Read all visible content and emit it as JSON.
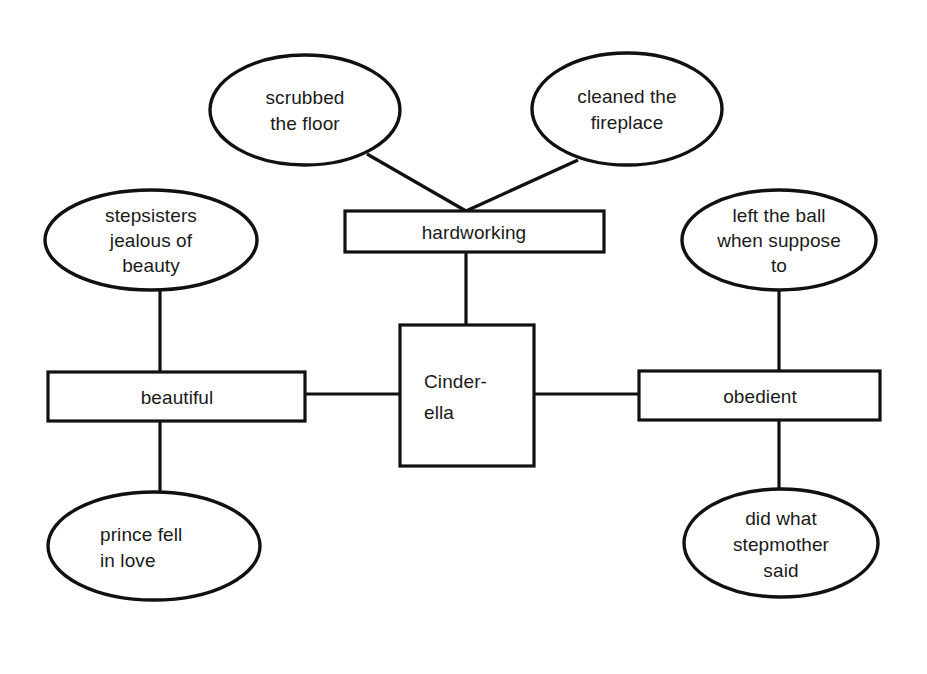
{
  "diagram": {
    "type": "concept-web",
    "background_color": "#ffffff",
    "stroke_color": "#111111",
    "text_color": "#1a1a1a",
    "center": {
      "id": "cinderella",
      "shape": "rectangle",
      "label_lines": [
        "Cinder-",
        "ella"
      ],
      "line1": "Cinder-",
      "line2": "ella"
    },
    "attributes": [
      {
        "id": "hardworking",
        "shape": "rectangle",
        "label": "hardworking",
        "position": "top"
      },
      {
        "id": "beautiful",
        "shape": "rectangle",
        "label": "beautiful",
        "position": "left"
      },
      {
        "id": "obedient",
        "shape": "rectangle",
        "label": "obedient",
        "position": "right"
      }
    ],
    "details": [
      {
        "id": "scrubbed-the-floor",
        "shape": "ellipse",
        "parent": "hardworking",
        "line1": "scrubbed",
        "line2": "the floor",
        "line3": ""
      },
      {
        "id": "cleaned-the-fireplace",
        "shape": "ellipse",
        "parent": "hardworking",
        "line1": "cleaned the",
        "line2": "fireplace",
        "line3": ""
      },
      {
        "id": "stepsisters-jealous-of-beauty",
        "shape": "ellipse",
        "parent": "beautiful",
        "line1": "stepsisters",
        "line2": "jealous of",
        "line3": "beauty"
      },
      {
        "id": "prince-fell-in-love",
        "shape": "ellipse",
        "parent": "beautiful",
        "line1": "prince fell",
        "line2": "in love",
        "line3": ""
      },
      {
        "id": "left-the-ball-when-suppose-to",
        "shape": "ellipse",
        "parent": "obedient",
        "line1": "left the ball",
        "line2": "when suppose",
        "line3": "to"
      },
      {
        "id": "did-what-stepmother-said",
        "shape": "ellipse",
        "parent": "obedient",
        "line1": "did what",
        "line2": "stepmother",
        "line3": "said"
      }
    ],
    "connections": [
      {
        "from": "scrubbed-the-floor",
        "to": "hardworking"
      },
      {
        "from": "cleaned-the-fireplace",
        "to": "hardworking"
      },
      {
        "from": "hardworking",
        "to": "cinderella"
      },
      {
        "from": "stepsisters-jealous-of-beauty",
        "to": "beautiful"
      },
      {
        "from": "beautiful",
        "to": "prince-fell-in-love"
      },
      {
        "from": "beautiful",
        "to": "cinderella"
      },
      {
        "from": "cinderella",
        "to": "obedient"
      },
      {
        "from": "left-the-ball-when-suppose-to",
        "to": "obedient"
      },
      {
        "from": "obedient",
        "to": "did-what-stepmother-said"
      }
    ]
  }
}
